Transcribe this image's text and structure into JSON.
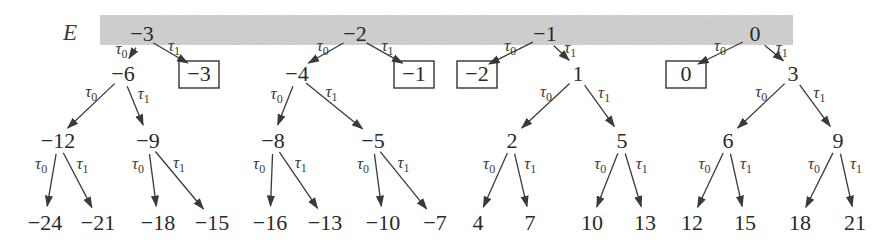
{
  "title_label": "E",
  "band": {
    "x": 100,
    "y": 15,
    "width": 693,
    "height": 30,
    "color": "#c8c8c8"
  },
  "colors": {
    "ink": "#2a2a2a",
    "edge": "#3a3a3a",
    "band": "#c8c8c8"
  },
  "edge_labels": {
    "left": "τ",
    "left_sub": "0",
    "right": "τ",
    "right_sub": "1"
  },
  "nodes": [
    {
      "id": "r0",
      "label": "−3",
      "x": 142,
      "y": 33,
      "boxed": false,
      "level": 0
    },
    {
      "id": "r1",
      "label": "−2",
      "x": 355,
      "y": 33,
      "boxed": false,
      "level": 0
    },
    {
      "id": "r2",
      "label": "−1",
      "x": 545,
      "y": 33,
      "boxed": false,
      "level": 0
    },
    {
      "id": "r3",
      "label": "0",
      "x": 755,
      "y": 33,
      "boxed": false,
      "level": 0
    },
    {
      "id": "a0",
      "label": "−6",
      "x": 123,
      "y": 73,
      "boxed": false,
      "level": 1
    },
    {
      "id": "a1",
      "label": "−3",
      "x": 199,
      "y": 73,
      "boxed": true,
      "level": 1
    },
    {
      "id": "b0",
      "label": "−4",
      "x": 297,
      "y": 73,
      "boxed": false,
      "level": 1
    },
    {
      "id": "b1",
      "label": "−1",
      "x": 414,
      "y": 73,
      "boxed": true,
      "level": 1
    },
    {
      "id": "c0",
      "label": "−2",
      "x": 477,
      "y": 73,
      "boxed": true,
      "level": 1
    },
    {
      "id": "c1",
      "label": "1",
      "x": 578,
      "y": 73,
      "boxed": false,
      "level": 1
    },
    {
      "id": "d0",
      "label": "0",
      "x": 686,
      "y": 73,
      "boxed": true,
      "level": 1
    },
    {
      "id": "d1",
      "label": "3",
      "x": 793,
      "y": 73,
      "boxed": false,
      "level": 1
    },
    {
      "id": "a00",
      "label": "−12",
      "x": 58,
      "y": 140,
      "boxed": false,
      "level": 2
    },
    {
      "id": "a01",
      "label": "−9",
      "x": 148,
      "y": 140,
      "boxed": false,
      "level": 2
    },
    {
      "id": "b00",
      "label": "−8",
      "x": 273,
      "y": 140,
      "boxed": false,
      "level": 2
    },
    {
      "id": "b01",
      "label": "−5",
      "x": 373,
      "y": 140,
      "boxed": false,
      "level": 2
    },
    {
      "id": "c10",
      "label": "2",
      "x": 512,
      "y": 140,
      "boxed": false,
      "level": 2
    },
    {
      "id": "c11",
      "label": "5",
      "x": 622,
      "y": 140,
      "boxed": false,
      "level": 2
    },
    {
      "id": "d10",
      "label": "6",
      "x": 728,
      "y": 140,
      "boxed": false,
      "level": 2
    },
    {
      "id": "d11",
      "label": "9",
      "x": 838,
      "y": 140,
      "boxed": false,
      "level": 2
    },
    {
      "id": "l0",
      "label": "−24",
      "x": 45,
      "y": 222,
      "boxed": false,
      "level": 3
    },
    {
      "id": "l1",
      "label": "−21",
      "x": 98,
      "y": 222,
      "boxed": false,
      "level": 3
    },
    {
      "id": "l2",
      "label": "−18",
      "x": 158,
      "y": 222,
      "boxed": false,
      "level": 3
    },
    {
      "id": "l3",
      "label": "−15",
      "x": 212,
      "y": 222,
      "boxed": false,
      "level": 3
    },
    {
      "id": "l4",
      "label": "−16",
      "x": 270,
      "y": 222,
      "boxed": false,
      "level": 3
    },
    {
      "id": "l5",
      "label": "−13",
      "x": 325,
      "y": 222,
      "boxed": false,
      "level": 3
    },
    {
      "id": "l6",
      "label": "−10",
      "x": 383,
      "y": 222,
      "boxed": false,
      "level": 3
    },
    {
      "id": "l7",
      "label": "−7",
      "x": 435,
      "y": 222,
      "boxed": false,
      "level": 3
    },
    {
      "id": "l8",
      "label": "4",
      "x": 478,
      "y": 222,
      "boxed": false,
      "level": 3
    },
    {
      "id": "l9",
      "label": "7",
      "x": 530,
      "y": 222,
      "boxed": false,
      "level": 3
    },
    {
      "id": "l10",
      "label": "10",
      "x": 592,
      "y": 222,
      "boxed": false,
      "level": 3
    },
    {
      "id": "l11",
      "label": "13",
      "x": 645,
      "y": 222,
      "boxed": false,
      "level": 3
    },
    {
      "id": "l12",
      "label": "12",
      "x": 692,
      "y": 222,
      "boxed": false,
      "level": 3
    },
    {
      "id": "l13",
      "label": "15",
      "x": 745,
      "y": 222,
      "boxed": false,
      "level": 3
    },
    {
      "id": "l14",
      "label": "18",
      "x": 800,
      "y": 222,
      "boxed": false,
      "level": 3
    },
    {
      "id": "l15",
      "label": "21",
      "x": 855,
      "y": 222,
      "boxed": false,
      "level": 3
    }
  ],
  "edges": [
    {
      "from": "r0",
      "to": "a0",
      "op": "tau0"
    },
    {
      "from": "r0",
      "to": "a1",
      "op": "tau1"
    },
    {
      "from": "r1",
      "to": "b0",
      "op": "tau0"
    },
    {
      "from": "r1",
      "to": "b1",
      "op": "tau1"
    },
    {
      "from": "r2",
      "to": "c0",
      "op": "tau0"
    },
    {
      "from": "r2",
      "to": "c1",
      "op": "tau1"
    },
    {
      "from": "r3",
      "to": "d0",
      "op": "tau0"
    },
    {
      "from": "r3",
      "to": "d1",
      "op": "tau1"
    },
    {
      "from": "a0",
      "to": "a00",
      "op": "tau0"
    },
    {
      "from": "a0",
      "to": "a01",
      "op": "tau1"
    },
    {
      "from": "b0",
      "to": "b00",
      "op": "tau0"
    },
    {
      "from": "b0",
      "to": "b01",
      "op": "tau1"
    },
    {
      "from": "c1",
      "to": "c10",
      "op": "tau0"
    },
    {
      "from": "c1",
      "to": "c11",
      "op": "tau1"
    },
    {
      "from": "d1",
      "to": "d10",
      "op": "tau0"
    },
    {
      "from": "d1",
      "to": "d11",
      "op": "tau1"
    },
    {
      "from": "a00",
      "to": "l0",
      "op": "tau0"
    },
    {
      "from": "a00",
      "to": "l1",
      "op": "tau1"
    },
    {
      "from": "a01",
      "to": "l2",
      "op": "tau0"
    },
    {
      "from": "a01",
      "to": "l3",
      "op": "tau1"
    },
    {
      "from": "b00",
      "to": "l4",
      "op": "tau0"
    },
    {
      "from": "b00",
      "to": "l5",
      "op": "tau1"
    },
    {
      "from": "b01",
      "to": "l6",
      "op": "tau0"
    },
    {
      "from": "b01",
      "to": "l7",
      "op": "tau1"
    },
    {
      "from": "c10",
      "to": "l8",
      "op": "tau0"
    },
    {
      "from": "c10",
      "to": "l9",
      "op": "tau1"
    },
    {
      "from": "c11",
      "to": "l10",
      "op": "tau0"
    },
    {
      "from": "c11",
      "to": "l11",
      "op": "tau1"
    },
    {
      "from": "d10",
      "to": "l12",
      "op": "tau0"
    },
    {
      "from": "d10",
      "to": "l13",
      "op": "tau1"
    },
    {
      "from": "d11",
      "to": "l14",
      "op": "tau0"
    },
    {
      "from": "d11",
      "to": "l15",
      "op": "tau1"
    }
  ]
}
